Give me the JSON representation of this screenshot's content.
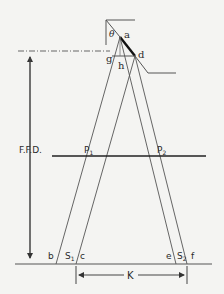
{
  "diagram": {
    "labels": {
      "theta": "θ",
      "a": "a",
      "d": "d",
      "g": "g",
      "h": "h",
      "ffd": "F.F.D.",
      "p1": "P",
      "p1_sub": "1",
      "p2": "P",
      "p2_sub": "2",
      "b": "b",
      "s1": "S",
      "s1_sub": "1",
      "c": "c",
      "e": "e",
      "s2": "S",
      "s2_sub": "2",
      "f": "f",
      "k": "K"
    },
    "colors": {
      "line": "#555555",
      "bold_line": "#111111",
      "background": "#f4f4f2"
    }
  }
}
